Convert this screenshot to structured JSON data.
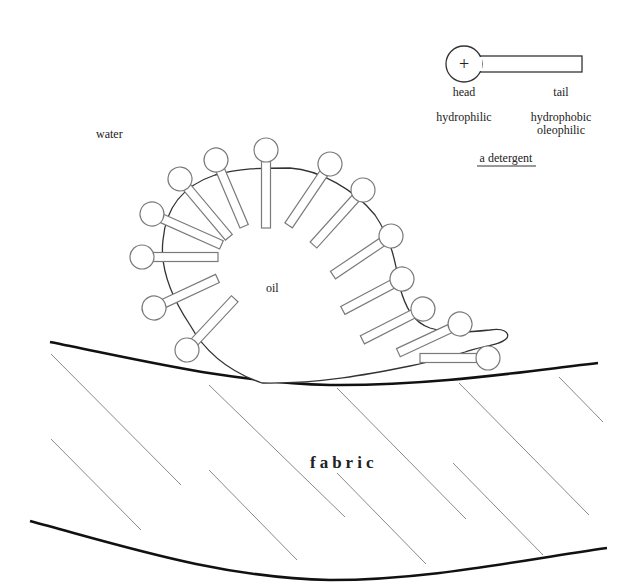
{
  "diagram": {
    "labels": {
      "water": "water",
      "oil": "oil",
      "fabric": "fabric"
    },
    "legend": {
      "head_label": "head",
      "tail_label": "tail",
      "head_property": "hydrophilic",
      "tail_property_1": "hydrophobic",
      "tail_property_2": "oleophilic",
      "caption": "a detergent",
      "head_symbol": "+"
    },
    "colors": {
      "outline": "#7a7a7a",
      "oil_outline": "#333333",
      "fabric_edge": "#111111",
      "hatch": "#8a8a8a",
      "background": "#ffffff"
    },
    "molecules": [
      {
        "id": "m1",
        "head": [
          142,
          257
        ],
        "tail_end": [
          218,
          257
        ]
      },
      {
        "id": "m2",
        "head": [
          152,
          214
        ],
        "tail_end": [
          222,
          245
        ]
      },
      {
        "id": "m3",
        "head": [
          180,
          179
        ],
        "tail_end": [
          228,
          237
        ]
      },
      {
        "id": "m4",
        "head": [
          216,
          160
        ],
        "tail_end": [
          243,
          225
        ]
      },
      {
        "id": "m5",
        "head": [
          266,
          150
        ],
        "tail_end": [
          266,
          228
        ]
      },
      {
        "id": "m6",
        "head": [
          330,
          164
        ],
        "tail_end": [
          288,
          226
        ]
      },
      {
        "id": "m7",
        "head": [
          363,
          190
        ],
        "tail_end": [
          313,
          246
        ]
      },
      {
        "id": "m8",
        "head": [
          391,
          236
        ],
        "tail_end": [
          334,
          275
        ]
      },
      {
        "id": "m9",
        "head": [
          402,
          279
        ],
        "tail_end": [
          343,
          310
        ]
      },
      {
        "id": "m10",
        "head": [
          423,
          309
        ],
        "tail_end": [
          362,
          340
        ]
      },
      {
        "id": "m11",
        "head": [
          460,
          324
        ],
        "tail_end": [
          398,
          353
        ]
      },
      {
        "id": "m12",
        "head": [
          488,
          358
        ],
        "tail_end": [
          420,
          358
        ]
      },
      {
        "id": "m13",
        "head": [
          154,
          308
        ],
        "tail_end": [
          217,
          278
        ]
      },
      {
        "id": "m14",
        "head": [
          187,
          350
        ],
        "tail_end": [
          233,
          300
        ]
      }
    ]
  }
}
